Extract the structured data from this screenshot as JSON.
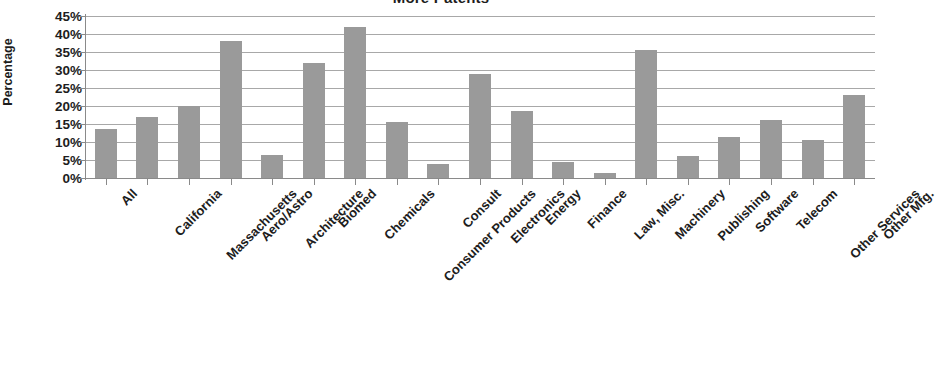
{
  "chart_data": {
    "type": "bar",
    "title": "More Patents",
    "xlabel": "",
    "ylabel": "Percentage",
    "ylim": [
      0,
      45
    ],
    "ytick_labels": [
      "45%",
      "40%",
      "35%",
      "30%",
      "25%",
      "20%",
      "15%",
      "10%",
      "5%",
      "0%"
    ],
    "ytick_values": [
      45,
      40,
      35,
      30,
      25,
      20,
      15,
      10,
      5,
      0
    ],
    "grid": true,
    "legend": null,
    "bar_color": "#9a9a9a",
    "categories": [
      "All",
      "California",
      "Massachusetts",
      "Aero/Astro",
      "Architecture",
      "Biomed",
      "Chemicals",
      "Consumer Products",
      "Consult",
      "Electronics",
      "Energy",
      "Finance",
      "Law, Misc.",
      "Machinery",
      "Publishing",
      "Software",
      "Telecom",
      "Other Services",
      "Other Mfg."
    ],
    "values": [
      13.5,
      17,
      20,
      38,
      6.5,
      32,
      42,
      15.5,
      4,
      29,
      18.5,
      4.5,
      1.5,
      35.5,
      6,
      11.5,
      16,
      10.5,
      23
    ]
  }
}
